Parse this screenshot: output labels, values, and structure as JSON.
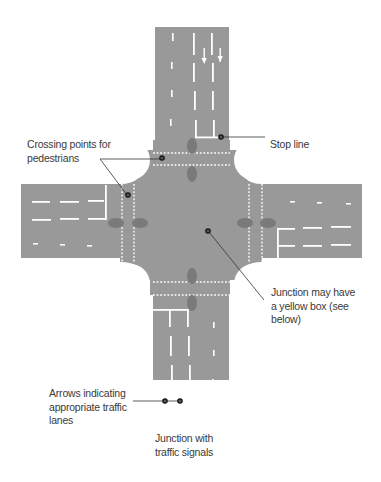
{
  "diagram": {
    "title": "Junction with traffic signals",
    "caption_lines": [
      "Junction with",
      "traffic signals"
    ],
    "colors": {
      "road": "#999999",
      "marking": "#ffffff",
      "signal": "#7a7a7a",
      "callout_line": "#333333",
      "text": "#3a3a3a",
      "background": "#ffffff"
    },
    "labels": [
      {
        "id": "crossing",
        "lines": [
          "Crossing points for",
          "pedestrians"
        ]
      },
      {
        "id": "stopline",
        "lines": [
          "Stop line"
        ]
      },
      {
        "id": "yellowbox",
        "lines": [
          "Junction may have",
          "a yellow box (see",
          "below)"
        ]
      },
      {
        "id": "arrows",
        "lines": [
          "Arrows indicating",
          "appropriate traffic",
          "lanes"
        ]
      }
    ]
  }
}
